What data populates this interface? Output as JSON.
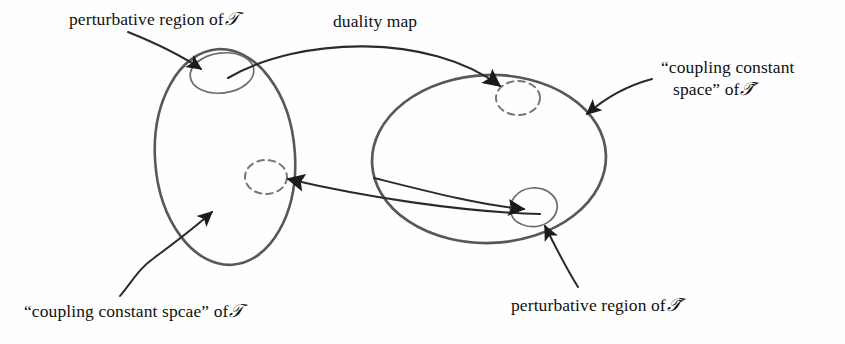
{
  "figure": {
    "kind": "duality-map-diagram",
    "background_color": "#fefefe",
    "stroke_color": "#4a4a4a",
    "ink_color": "#1a1a1a",
    "width": 845,
    "height": 344
  },
  "labels": {
    "perturbative_left": {
      "text": "perturbative region of",
      "symbol": "𝒯",
      "x": 69,
      "y": 8
    },
    "duality_map": {
      "text": "duality map",
      "x": 333,
      "y": 11
    },
    "coupling_right_line1": {
      "text": "“coupling constant"
    },
    "coupling_right_line2": {
      "text": "space” of",
      "symbol": "𝒯̃"
    },
    "coupling_left": {
      "text": "“coupling constant spcae” of",
      "symbol": "𝒯",
      "x": 24,
      "y": 300
    },
    "perturbative_right": {
      "text": "perturbative region of",
      "symbol": "𝒯̃",
      "x": 511,
      "y": 294
    }
  },
  "shapes": {
    "left_space_ellipse": {
      "name": "coupling constant space of T",
      "cx": 225,
      "cy": 157,
      "rx": 70,
      "ry": 108,
      "rotation": -4,
      "style": "solid"
    },
    "left_perturbative_ellipse": {
      "name": "perturbative region of T",
      "cx": 222,
      "cy": 73,
      "rx": 32,
      "ry": 20,
      "rotation": -6,
      "style": "solid"
    },
    "left_dashed_ellipse": {
      "name": "image of perturbative region of T-tilde",
      "cx": 266,
      "cy": 177,
      "rx": 21,
      "ry": 17,
      "rotation": 0,
      "style": "dashed"
    },
    "right_space_ellipse": {
      "name": "coupling constant space of T-tilde",
      "cx": 489,
      "cy": 159,
      "rx": 117,
      "ry": 84,
      "rotation": -2,
      "style": "solid"
    },
    "right_dashed_ellipse": {
      "name": "image of perturbative region of T",
      "cx": 518,
      "cy": 98,
      "rx": 22,
      "ry": 17,
      "rotation": 0,
      "style": "dashed"
    },
    "right_perturbative_ellipse": {
      "name": "perturbative region of T-tilde",
      "cx": 534,
      "cy": 209,
      "rx": 24,
      "ry": 21,
      "rotation": 0,
      "style": "solid"
    }
  },
  "arrows": {
    "duality_map_arrow": {
      "from": "left perturbative region",
      "to": "right dashed region",
      "label": "duality map"
    },
    "inverse_map_arrow": {
      "from": "right perturbative region",
      "to": "left dashed region"
    },
    "leader_perturbative_left": {
      "from": "label",
      "to": "left perturbative ellipse"
    },
    "leader_coupling_right": {
      "from": "label",
      "to": "right space ellipse boundary"
    },
    "leader_coupling_left": {
      "from": "label",
      "to": "left space ellipse interior"
    },
    "leader_perturbative_right": {
      "from": "label",
      "to": "right perturbative ellipse"
    }
  }
}
